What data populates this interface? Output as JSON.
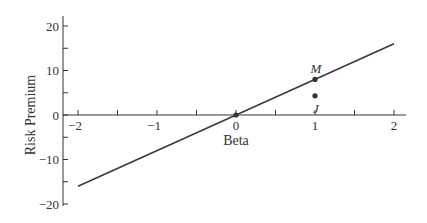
{
  "chart_data": {
    "type": "line",
    "title": "",
    "xlabel": "Beta",
    "ylabel": "Risk Premium",
    "xlim": [
      -2,
      2
    ],
    "ylim": [
      -20,
      20
    ],
    "x_ticks": [
      -2,
      -1,
      0,
      1,
      2
    ],
    "x_tick_labels": [
      "−2",
      "−1",
      "0",
      "1",
      "2"
    ],
    "x_minor_ticks": [
      -1.5,
      -0.5,
      0.5,
      1.5
    ],
    "y_ticks": [
      20,
      10,
      0,
      -10,
      -20
    ],
    "y_tick_labels": [
      "20",
      "10",
      "0",
      "−10",
      "−20"
    ],
    "y_minor_ticks": [
      15,
      5,
      -5,
      -15
    ],
    "grid": false,
    "series": [
      {
        "name": "Security Market Line",
        "x": [
          -2,
          2
        ],
        "y": [
          -16,
          16
        ]
      }
    ],
    "points": [
      {
        "label": "M",
        "x": 1,
        "y": 8
      },
      {
        "label": "J",
        "x": 1,
        "y": 4.3
      },
      {
        "label": "",
        "x": 0,
        "y": 0
      }
    ]
  }
}
